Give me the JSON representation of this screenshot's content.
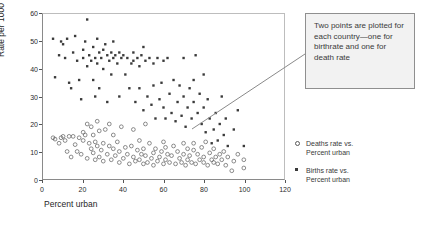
{
  "chart_data": {
    "type": "scatter",
    "title": "",
    "xlabel": "Percent urban",
    "ylabel": "Rate per 1000",
    "xlim": [
      0,
      120
    ],
    "ylim": [
      0,
      60
    ],
    "xticks": [
      0,
      20,
      40,
      60,
      80,
      100,
      120
    ],
    "yticks": [
      0,
      10,
      20,
      30,
      40,
      50,
      60
    ],
    "grid": false,
    "legend_position": "right",
    "series": [
      {
        "name": "Deaths rate vs. Percent urban",
        "marker": "open-circle",
        "color": "#5a5a5a",
        "points": [
          [
            5,
            15
          ],
          [
            6,
            14.5
          ],
          [
            8,
            13
          ],
          [
            9,
            15
          ],
          [
            10,
            15.5
          ],
          [
            11,
            14
          ],
          [
            12,
            10
          ],
          [
            13,
            15.5
          ],
          [
            14,
            8
          ],
          [
            15,
            15.5
          ],
          [
            16,
            12.5
          ],
          [
            17,
            10
          ],
          [
            18,
            15
          ],
          [
            19,
            9
          ],
          [
            20,
            17
          ],
          [
            20,
            14
          ],
          [
            21,
            16
          ],
          [
            22,
            7.5
          ],
          [
            22,
            20
          ],
          [
            23,
            13
          ],
          [
            24,
            11
          ],
          [
            24,
            19
          ],
          [
            25,
            9.5
          ],
          [
            25,
            16
          ],
          [
            26,
            7
          ],
          [
            26,
            13.5
          ],
          [
            27,
            12
          ],
          [
            27,
            21
          ],
          [
            28,
            8
          ],
          [
            28,
            17.5
          ],
          [
            29,
            10.5
          ],
          [
            30,
            13
          ],
          [
            30,
            6.5
          ],
          [
            31,
            18
          ],
          [
            32,
            9
          ],
          [
            33,
            12
          ],
          [
            33,
            20
          ],
          [
            34,
            7
          ],
          [
            35,
            11
          ],
          [
            35,
            16
          ],
          [
            36,
            8.5
          ],
          [
            37,
            13.5
          ],
          [
            38,
            6
          ],
          [
            38,
            10
          ],
          [
            39,
            19
          ],
          [
            40,
            7.5
          ],
          [
            41,
            11.5
          ],
          [
            42,
            9
          ],
          [
            43,
            5.5
          ],
          [
            44,
            12
          ],
          [
            45,
            8
          ],
          [
            45,
            18
          ],
          [
            46,
            6.5
          ],
          [
            47,
            10.5
          ],
          [
            48,
            7
          ],
          [
            48,
            14
          ],
          [
            49,
            9
          ],
          [
            50,
            5.5
          ],
          [
            50,
            11
          ],
          [
            51,
            8.5
          ],
          [
            51,
            20
          ],
          [
            52,
            6
          ],
          [
            53,
            13
          ],
          [
            54,
            7.5
          ],
          [
            55,
            9.5
          ],
          [
            55,
            5
          ],
          [
            56,
            11
          ],
          [
            57,
            6.5
          ],
          [
            58,
            8
          ],
          [
            59,
            10
          ],
          [
            60,
            5.5
          ],
          [
            60,
            13.5
          ],
          [
            61,
            7
          ],
          [
            61,
            11.5
          ],
          [
            62,
            9
          ],
          [
            63,
            6
          ],
          [
            64,
            8.5
          ],
          [
            65,
            12
          ],
          [
            66,
            5.5
          ],
          [
            67,
            10
          ],
          [
            68,
            7.5
          ],
          [
            69,
            6
          ],
          [
            70,
            9
          ],
          [
            70,
            13
          ],
          [
            71,
            5
          ],
          [
            72,
            11
          ],
          [
            72,
            7
          ],
          [
            73,
            8.5
          ],
          [
            74,
            6
          ],
          [
            75,
            10.5
          ],
          [
            75,
            13
          ],
          [
            76,
            5.5
          ],
          [
            77,
            9
          ],
          [
            78,
            7
          ],
          [
            79,
            11.5
          ],
          [
            80,
            6
          ],
          [
            80,
            8
          ],
          [
            81,
            13.5
          ],
          [
            82,
            5
          ],
          [
            83,
            9.5
          ],
          [
            84,
            7
          ],
          [
            85,
            11
          ],
          [
            85,
            6
          ],
          [
            86,
            8
          ],
          [
            87,
            5.5
          ],
          [
            88,
            9
          ],
          [
            89,
            7
          ],
          [
            90,
            10
          ],
          [
            91,
            5
          ],
          [
            92,
            8
          ],
          [
            94,
            3
          ],
          [
            95,
            6.5
          ],
          [
            97,
            9
          ],
          [
            100,
            7
          ],
          [
            100,
            4
          ]
        ]
      },
      {
        "name": "Births rate vs. Percent urban",
        "marker": "filled-square",
        "color": "#3a3a3a",
        "points": [
          [
            5,
            51
          ],
          [
            6,
            37
          ],
          [
            8,
            45
          ],
          [
            9,
            50
          ],
          [
            10,
            49
          ],
          [
            11,
            44
          ],
          [
            12,
            51
          ],
          [
            13,
            35
          ],
          [
            14,
            33
          ],
          [
            15,
            46
          ],
          [
            16,
            52
          ],
          [
            17,
            43
          ],
          [
            18,
            36
          ],
          [
            19,
            29
          ],
          [
            20,
            47
          ],
          [
            20,
            44
          ],
          [
            21,
            50
          ],
          [
            22,
            58
          ],
          [
            22,
            41
          ],
          [
            23,
            45
          ],
          [
            24,
            43
          ],
          [
            25,
            36
          ],
          [
            25,
            48
          ],
          [
            26,
            44
          ],
          [
            26,
            30
          ],
          [
            27,
            51
          ],
          [
            27,
            42
          ],
          [
            28,
            46
          ],
          [
            28,
            33
          ],
          [
            29,
            44
          ],
          [
            30,
            47
          ],
          [
            30,
            40
          ],
          [
            31,
            49
          ],
          [
            32,
            45
          ],
          [
            32,
            28
          ],
          [
            33,
            43
          ],
          [
            34,
            46
          ],
          [
            34,
            38
          ],
          [
            35,
            50
          ],
          [
            35,
            44
          ],
          [
            36,
            45
          ],
          [
            37,
            42
          ],
          [
            38,
            30
          ],
          [
            38,
            46
          ],
          [
            39,
            44
          ],
          [
            40,
            45
          ],
          [
            41,
            38
          ],
          [
            42,
            44
          ],
          [
            43,
            33
          ],
          [
            44,
            42
          ],
          [
            45,
            46
          ],
          [
            45,
            43
          ],
          [
            46,
            28
          ],
          [
            47,
            44
          ],
          [
            48,
            41
          ],
          [
            48,
            33
          ],
          [
            49,
            45
          ],
          [
            50,
            48
          ],
          [
            50,
            25
          ],
          [
            51,
            43
          ],
          [
            52,
            30
          ],
          [
            53,
            44
          ],
          [
            54,
            27
          ],
          [
            55,
            42
          ],
          [
            55,
            34
          ],
          [
            56,
            22
          ],
          [
            57,
            44
          ],
          [
            58,
            29
          ],
          [
            59,
            35
          ],
          [
            60,
            43
          ],
          [
            60,
            26
          ],
          [
            61,
            22
          ],
          [
            62,
            44
          ],
          [
            63,
            31
          ],
          [
            64,
            24
          ],
          [
            65,
            36
          ],
          [
            66,
            21
          ],
          [
            67,
            28
          ],
          [
            68,
            34
          ],
          [
            69,
            23
          ],
          [
            70,
            44
          ],
          [
            70,
            30
          ],
          [
            71,
            19
          ],
          [
            72,
            26
          ],
          [
            73,
            33
          ],
          [
            74,
            22
          ],
          [
            75,
            36
          ],
          [
            75,
            28
          ],
          [
            76,
            45
          ],
          [
            77,
            24
          ],
          [
            78,
            31
          ],
          [
            79,
            20
          ],
          [
            80,
            38
          ],
          [
            80,
            26
          ],
          [
            81,
            17
          ],
          [
            82,
            29
          ],
          [
            83,
            22
          ],
          [
            84,
            13
          ],
          [
            85,
            18
          ],
          [
            86,
            24
          ],
          [
            87,
            14
          ],
          [
            88,
            20
          ],
          [
            89,
            30
          ],
          [
            90,
            16
          ],
          [
            91,
            22
          ],
          [
            92,
            12
          ],
          [
            95,
            18
          ],
          [
            97,
            25
          ],
          [
            100,
            12
          ]
        ]
      }
    ],
    "annotations": [
      {
        "text": "Two points are plotted for each country—one for birthrate and one for death rate",
        "anchor_x": 94,
        "anchor_y": 20
      }
    ]
  },
  "callout": {
    "line1": "Two points are",
    "line2": "plotted for each",
    "line3": "country—one for",
    "line4": "birthrate and one for",
    "line5": "death rate"
  },
  "legend": {
    "deaths": {
      "line1": "Deaths rate vs.",
      "line2": "Percent urban"
    },
    "births": {
      "line1": "Births rate vs.",
      "line2": "Percent urban"
    }
  }
}
